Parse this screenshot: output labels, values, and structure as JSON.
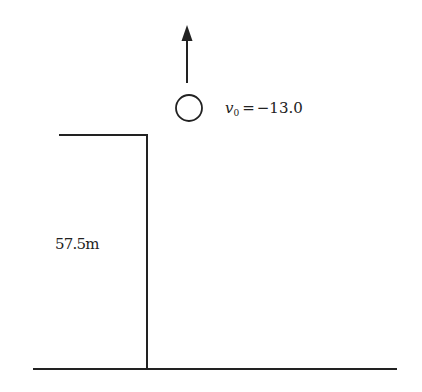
{
  "diagram": {
    "height_label": "57.5m",
    "velocity_symbol": "v",
    "velocity_subscript": "0",
    "velocity_equals": "=",
    "velocity_value": "−13.0",
    "colors": {
      "line": "#222222",
      "background": "#ffffff"
    }
  }
}
